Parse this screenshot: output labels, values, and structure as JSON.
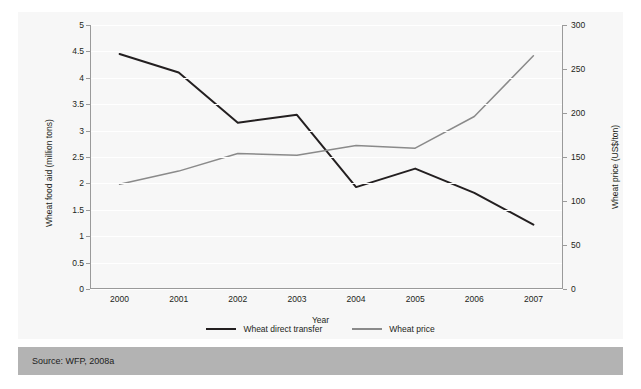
{
  "figure": {
    "clipped_title": "",
    "source": "Source: WFP, 2008a"
  },
  "chart_data": {
    "type": "line",
    "title": "",
    "xlabel": "Year",
    "categories": [
      "2000",
      "2001",
      "2002",
      "2003",
      "2004",
      "2005",
      "2006",
      "2007"
    ],
    "grid": true,
    "legend_position": "bottom-center",
    "axes": {
      "left": {
        "label": "Wheat food aid (million tons)",
        "ticks": [
          "0",
          "0.5",
          "1",
          "1.5",
          "2",
          "2.5",
          "3",
          "3.5",
          "4",
          "4.5",
          "5"
        ],
        "tick_values": [
          0,
          0.5,
          1,
          1.5,
          2,
          2.5,
          3,
          3.5,
          4,
          4.5,
          5
        ],
        "lim": [
          0,
          5
        ]
      },
      "right": {
        "label": "Wheat price (US$/ton)",
        "ticks": [
          "0",
          "50",
          "100",
          "150",
          "200",
          "250",
          "300"
        ],
        "tick_values": [
          0,
          50,
          100,
          150,
          200,
          250,
          300
        ],
        "lim": [
          0,
          300
        ]
      }
    },
    "series": [
      {
        "name": "Wheat direct transfer",
        "axis": "left",
        "color": "#231f20",
        "values": [
          4.45,
          4.1,
          3.15,
          3.3,
          1.93,
          2.28,
          1.82,
          1.22
        ]
      },
      {
        "name": "Wheat price",
        "axis": "right",
        "color": "#8a8a8a",
        "values": [
          119,
          134,
          154,
          152,
          163,
          160,
          196,
          265
        ]
      }
    ]
  }
}
